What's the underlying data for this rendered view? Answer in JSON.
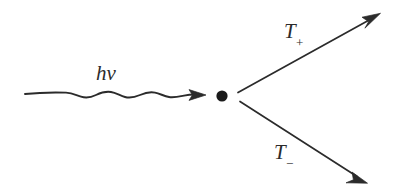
{
  "figure": {
    "background_color": "#ffffff",
    "stroke_color": "#2b2b2b",
    "width": 397,
    "height": 195
  },
  "labels": {
    "incoming": {
      "name": "hv-label",
      "base": "h",
      "symbol": "ν",
      "text": "hν",
      "meaning": "photon-energy"
    },
    "outgoing_upper": {
      "name": "t-plus-label",
      "base": "T",
      "subscript": "+",
      "text": "T",
      "meaning": "positive-track"
    },
    "outgoing_lower": {
      "name": "t-minus-label",
      "base": "T",
      "subscript": "−",
      "text": "T",
      "meaning": "negative-track"
    }
  },
  "elements": {
    "photon_wave": {
      "name": "photon-wavy-line",
      "start_x": 25,
      "start_y": 94,
      "end_x": 205,
      "end_y": 95,
      "amplitude": 4,
      "cycles": 6
    },
    "photon_arrowhead": {
      "name": "photon-arrowhead",
      "tip_x": 205,
      "tip_y": 95
    },
    "vertex": {
      "name": "interaction-vertex-dot",
      "cx": 222,
      "cy": 96,
      "r": 5.6
    },
    "upper_branch": {
      "name": "upper-particle-arrow",
      "start_x": 238,
      "start_y": 92,
      "tip_x": 379,
      "tip_y": 14
    },
    "lower_branch": {
      "name": "lower-particle-arrow",
      "start_x": 240,
      "start_y": 101,
      "tip_x": 366,
      "tip_y": 183
    }
  }
}
